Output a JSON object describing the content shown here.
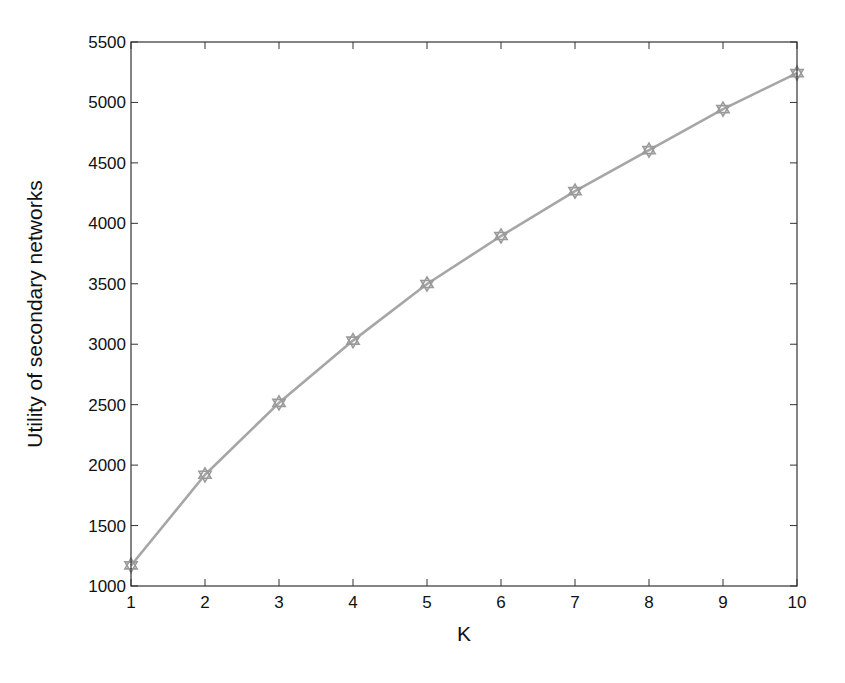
{
  "chart_data": {
    "type": "line",
    "title": "",
    "xlabel": "K",
    "ylabel": "Utility of secondary networks",
    "x": [
      1,
      2,
      3,
      4,
      5,
      6,
      7,
      8,
      9,
      10
    ],
    "series": [
      {
        "name": "Utility of secondary networks",
        "values": [
          1170,
          1920,
          2515,
          3030,
          3498,
          3895,
          4267,
          4606,
          4945,
          5243
        ],
        "color": "#a6a6a6",
        "marker": "hexagram"
      }
    ],
    "xlim": [
      1,
      10
    ],
    "ylim": [
      1000,
      5500
    ],
    "xticks": [
      1,
      2,
      3,
      4,
      5,
      6,
      7,
      8,
      9,
      10
    ],
    "yticks": [
      1000,
      1500,
      2000,
      2500,
      3000,
      3500,
      4000,
      4500,
      5000,
      5500
    ],
    "grid": false,
    "legend": null
  },
  "style": {
    "axis_color": "#333333",
    "line_color": "#a6a6a6",
    "marker_color": "#9a9a9a"
  }
}
